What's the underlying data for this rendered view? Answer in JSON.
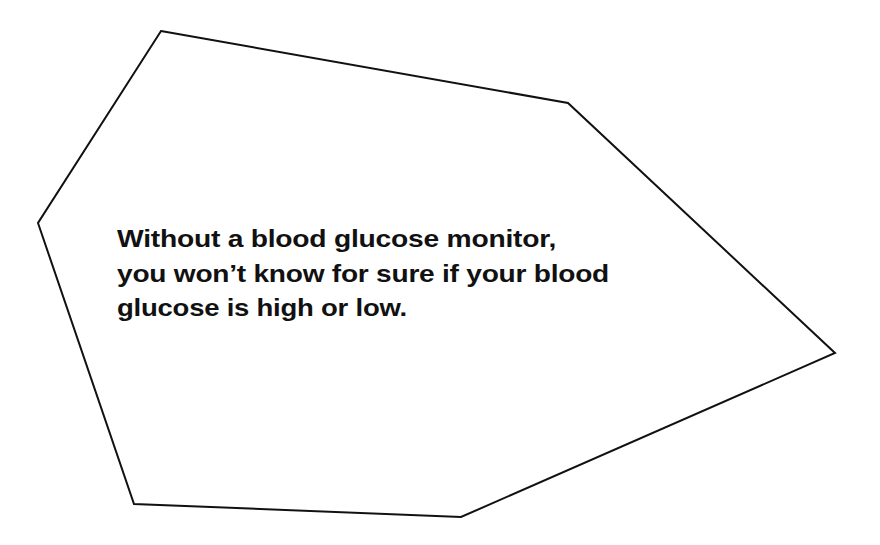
{
  "callout": {
    "shape": {
      "type": "polygon",
      "stroke_color": "#111111",
      "fill_color": "#ffffff",
      "stroke_width": 2,
      "points": [
        [
          161,
          31
        ],
        [
          568,
          103
        ],
        [
          835,
          353
        ],
        [
          461,
          517
        ],
        [
          134,
          504
        ],
        [
          38,
          223
        ]
      ]
    },
    "text_lines": [
      "Without a blood glucose monitor,",
      "you won’t know for sure if your blood",
      "glucose is high or low."
    ],
    "text_color": "#111111"
  }
}
